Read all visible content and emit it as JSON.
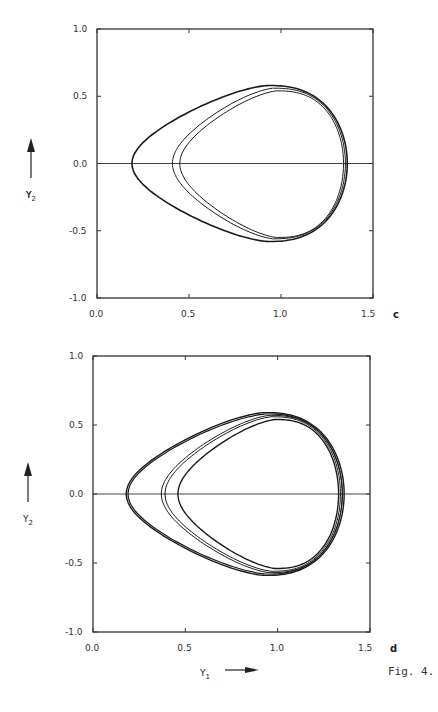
{
  "figure": {
    "caption": "Fig. 4.",
    "xlabel": "Y1",
    "ylabel": "Y2"
  },
  "chart_data": [
    {
      "type": "line",
      "panel": "c",
      "title": "",
      "xlabel": "",
      "ylabel": "Y2",
      "xlim": [
        0.0,
        1.5
      ],
      "ylim": [
        -1.0,
        1.0
      ],
      "xticks": [
        "0.0",
        "0.5",
        "1.0",
        "1.5"
      ],
      "yticks": [
        "1.0",
        "0.5",
        "0.0",
        "-0.5",
        "-1.0"
      ],
      "grid": false,
      "reference_line": {
        "y": 0.0
      },
      "series": [
        {
          "name": "orbit-outer",
          "left": 0.19,
          "right": 1.36,
          "top": 0.58,
          "bottom": -0.58,
          "peak_x": 0.93,
          "stroke": 1.6
        },
        {
          "name": "orbit-inner-1",
          "left": 0.41,
          "right": 1.35,
          "top": 0.56,
          "bottom": -0.56,
          "peak_x": 0.96,
          "stroke": 1.0
        },
        {
          "name": "orbit-inner-2",
          "left": 0.45,
          "right": 1.34,
          "top": 0.54,
          "bottom": -0.55,
          "peak_x": 0.98,
          "stroke": 1.0
        }
      ]
    },
    {
      "type": "line",
      "panel": "d",
      "title": "",
      "xlabel": "Y1",
      "ylabel": "Y2",
      "xlim": [
        0.0,
        1.5
      ],
      "ylim": [
        -1.0,
        1.0
      ],
      "xticks": [
        "0.0",
        "0.5",
        "1.0",
        "1.5"
      ],
      "yticks": [
        "1.0",
        "0.5",
        "0.0",
        "-0.5",
        "-1.0"
      ],
      "grid": false,
      "reference_line": {
        "y": 0.0
      },
      "series": [
        {
          "name": "orbit-outer-a",
          "left": 0.18,
          "right": 1.36,
          "top": 0.59,
          "bottom": -0.59,
          "peak_x": 0.93,
          "stroke": 1.4
        },
        {
          "name": "orbit-outer-b",
          "left": 0.19,
          "right": 1.35,
          "top": 0.58,
          "bottom": -0.58,
          "peak_x": 0.94,
          "stroke": 1.2
        },
        {
          "name": "orbit-mid-a",
          "left": 0.37,
          "right": 1.35,
          "top": 0.57,
          "bottom": -0.57,
          "peak_x": 0.96,
          "stroke": 1.0
        },
        {
          "name": "orbit-mid-b",
          "left": 0.39,
          "right": 1.34,
          "top": 0.56,
          "bottom": -0.56,
          "peak_x": 0.97,
          "stroke": 1.0
        },
        {
          "name": "orbit-inner",
          "left": 0.46,
          "right": 1.33,
          "top": 0.54,
          "bottom": -0.54,
          "peak_x": 0.99,
          "stroke": 1.4
        }
      ]
    }
  ]
}
